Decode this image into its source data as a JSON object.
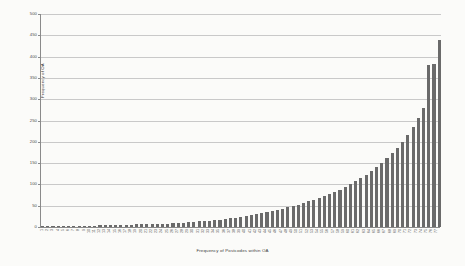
{
  "chart_data": {
    "type": "bar",
    "title": "",
    "xlabel": "Frequency of Postcodes within OA",
    "ylabel": "Frequency of OA",
    "ylim": [
      0,
      500
    ],
    "yticks": [
      0,
      50,
      100,
      150,
      200,
      250,
      300,
      350,
      400,
      450,
      500
    ],
    "grid": true,
    "legend": "none",
    "bar_color": "#6a6a6a",
    "gridline_color": "#c9c9c9",
    "axis_color": "#8a8a8a",
    "background_color": "#fbfbf9",
    "categories": [
      "1",
      "2",
      "3",
      "4",
      "5",
      "6",
      "7",
      "8",
      "9",
      "10",
      "11",
      "12",
      "13",
      "14",
      "15",
      "16",
      "17",
      "18",
      "19",
      "20",
      "21",
      "22",
      "23",
      "24",
      "25",
      "26",
      "27",
      "28",
      "29",
      "30",
      "31",
      "32",
      "33",
      "34",
      "35",
      "36",
      "37",
      "38",
      "39",
      "40",
      "41",
      "42",
      "43",
      "44",
      "45",
      "46",
      "47",
      "48",
      "49",
      "50",
      "51",
      "52",
      "53",
      "54",
      "55",
      "56",
      "57",
      "58",
      "59",
      "60",
      "61",
      "62",
      "63",
      "64",
      "65",
      "66",
      "67",
      "68",
      "69",
      "70",
      "71",
      "72",
      "73",
      "74",
      "75",
      "76",
      "77"
    ],
    "values": [
      1,
      1,
      1,
      2,
      2,
      2,
      2,
      3,
      3,
      3,
      3,
      4,
      4,
      4,
      4,
      5,
      5,
      5,
      6,
      6,
      6,
      7,
      7,
      8,
      8,
      9,
      9,
      10,
      11,
      12,
      13,
      14,
      15,
      16,
      17,
      19,
      21,
      22,
      24,
      26,
      28,
      30,
      33,
      35,
      37,
      40,
      43,
      46,
      49,
      52,
      56,
      60,
      64,
      68,
      73,
      78,
      83,
      88,
      94,
      100,
      107,
      114,
      122,
      131,
      140,
      150,
      161,
      173,
      186,
      200,
      216,
      234,
      255,
      280,
      380,
      382,
      440
    ]
  },
  "axis": {
    "y_title": "Frequency of OA",
    "x_title": "Frequency of Postcodes within OA"
  }
}
